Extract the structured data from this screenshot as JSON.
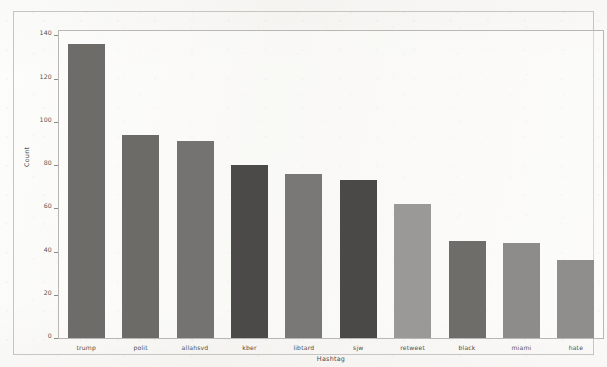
{
  "chart_data": {
    "type": "bar",
    "title": "",
    "xlabel": "Hashtag",
    "ylabel": "Count",
    "categories": [
      "trump",
      "polit",
      "allahsvd",
      "kber",
      "libtard",
      "sjw",
      "retweet",
      "black",
      "miami",
      "hate"
    ],
    "values": [
      136,
      94,
      91,
      80,
      76,
      73,
      62,
      45,
      44,
      36
    ],
    "bar_colors": [
      "#6e6c69",
      "#6d6b68",
      "#757371",
      "#4b4a48",
      "#7a7876",
      "#4a4947",
      "#9b9997",
      "#6f6d6a",
      "#8e8c8a",
      "#908e8c"
    ],
    "ylim": [
      0,
      142
    ],
    "yticks": [
      0,
      20,
      40,
      60,
      80,
      100,
      120,
      140
    ],
    "ytick_labels": [
      "0",
      "20",
      "40",
      "60",
      "80",
      "100",
      "120",
      "140"
    ],
    "grid": false,
    "legend": null,
    "legend_position": "none",
    "frame_color": "#c7c5c1",
    "axes_color": "#b9b7b3",
    "background_color": "#fbfaf8"
  }
}
